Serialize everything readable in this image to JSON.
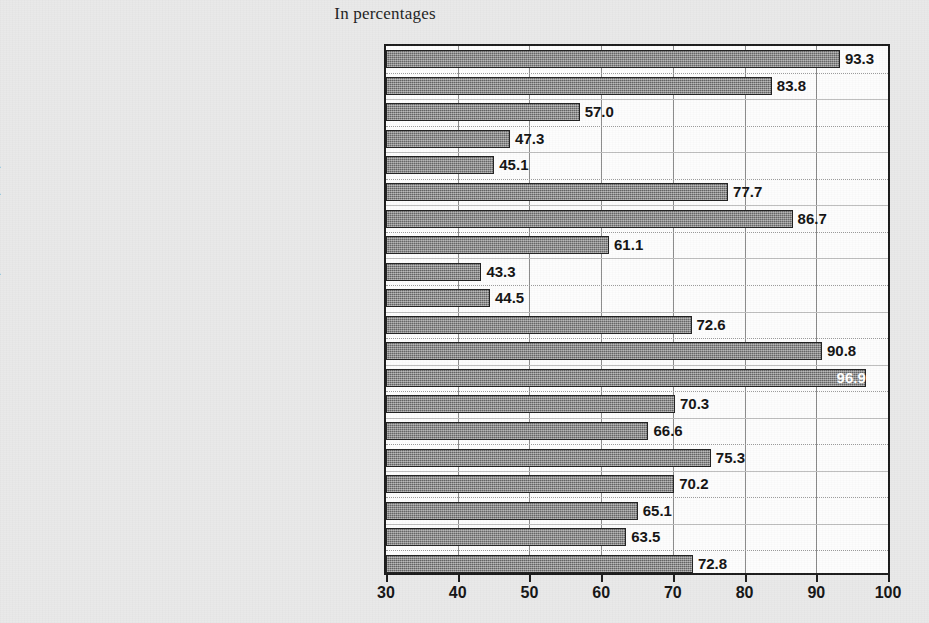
{
  "title": "In percentages",
  "chart_data": {
    "type": "bar",
    "orientation": "horizontal",
    "title": "In percentages",
    "xlabel": "",
    "ylabel": "",
    "xlim": [
      30,
      100
    ],
    "xticks": [
      30,
      40,
      50,
      60,
      70,
      80,
      90,
      100
    ],
    "grid": true,
    "legend": "none",
    "bar_color": "#7d7d7d",
    "bar_border_color": "#202020",
    "background_color": "#e9e9e9",
    "plot_background_color": "#fdfdfd",
    "categories": [
      "High income economies",
      "Upper-middle-income economies",
      "Lower-middle-income economies",
      "Low income economies",
      "Africa",
      "Eastern Europe and Central Asia",
      "Latin America and the Caribbean",
      "East Asia Pacific",
      "South Asia",
      "Micro (1-10 employees)",
      "Small (11-50 employees)",
      "Medium (51-150 employees)",
      "Large (more than 150 employees)",
      "Manufacturing",
      "Services",
      "Located in capitals",
      "Cities with > 1 million inhabitants",
      "Cities with > 250 000 and < 1 million inhabitants",
      "Cities with > 50 000 and < 250 000 inhabitants",
      "Cities with < 50 000 inhabitants"
    ],
    "values": [
      93.3,
      83.8,
      57.0,
      47.3,
      45.1,
      77.7,
      86.7,
      61.1,
      43.3,
      44.5,
      72.6,
      90.8,
      96.9,
      70.3,
      66.6,
      75.3,
      70.2,
      65.1,
      63.5,
      72.8
    ],
    "value_labels": [
      "93.3",
      "83.8",
      "57.0",
      "47.3",
      "45.1",
      "77.7",
      "86.7",
      "61.1",
      "43.3",
      "44.5",
      "72.6",
      "90.8",
      "96.9",
      "70.3",
      "66.6",
      "75.3",
      "70.2",
      "65.1",
      "63.5",
      "72.8"
    ],
    "label_inside_bar": [
      false,
      false,
      false,
      false,
      false,
      false,
      false,
      false,
      false,
      false,
      false,
      false,
      true,
      false,
      false,
      false,
      false,
      false,
      false,
      false
    ]
  }
}
